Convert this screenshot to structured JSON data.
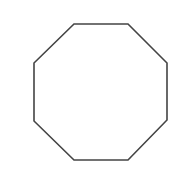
{
  "canvas": {
    "width": 183,
    "height": 176,
    "background": "#ffffff"
  },
  "shape": {
    "type": "octagon",
    "points": "74,24 128,24 167,63 167,120 128,160 74,160 34,121 34,63",
    "stroke": "#444444",
    "stroke_width": 1.6,
    "fill": "#ffffff"
  }
}
